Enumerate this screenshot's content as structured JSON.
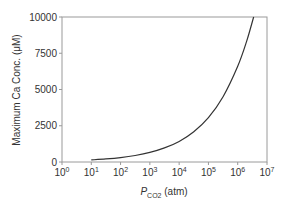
{
  "chart_data": {
    "type": "line",
    "title": "",
    "xlabel": "P_CO2 (atm)",
    "xlabel_main": "P",
    "xlabel_sub": "CO2",
    "xlabel_unit": " (atm)",
    "ylabel": "Maximum Ca Conc. (μM)",
    "xscale": "log",
    "xlim_exponents": [
      0,
      7
    ],
    "ylim": [
      0,
      10000
    ],
    "x_tick_base": "10",
    "x_tick_exponents": [
      "0",
      "1",
      "2",
      "3",
      "4",
      "5",
      "6",
      "7"
    ],
    "y_ticks": [
      "0",
      "2500",
      "5000",
      "7500",
      "10000"
    ],
    "grid": false,
    "legend": "none",
    "series": [
      {
        "name": "Maximum Ca concentration",
        "color": "#333333",
        "x": [
          10,
          31.6,
          100,
          316,
          1000,
          3162,
          10000,
          31623,
          100000,
          316228,
          1000000,
          2000000,
          3500000
        ],
        "y": [
          143,
          210,
          306,
          450,
          660,
          970,
          1420,
          2090,
          3060,
          4500,
          6600,
          8300,
          10000
        ]
      }
    ]
  }
}
